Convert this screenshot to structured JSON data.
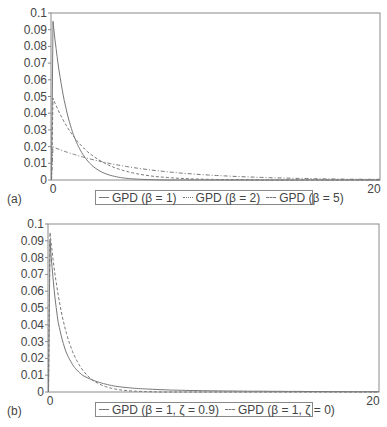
{
  "chart_data": [
    {
      "type": "line",
      "panel_label": "(a)",
      "title": "",
      "xlabel": "",
      "ylabel": "",
      "xlim": [
        0,
        20
      ],
      "ylim": [
        0,
        0.1
      ],
      "x_ticks": [
        "0",
        "20"
      ],
      "y_ticks": [
        "0",
        "0.01",
        "0.02",
        "0.03",
        "0.04",
        "0.05",
        "0.06",
        "0.07",
        "0.08",
        "0.09",
        "0.1"
      ],
      "grid": false,
      "legend_position": "bottom",
      "x": [
        0,
        0.5,
        1,
        1.5,
        2,
        3,
        4,
        5,
        6,
        8,
        10,
        12,
        14,
        16,
        18,
        20
      ],
      "series": [
        {
          "name": "GPD (β = 1)",
          "style": "solid",
          "values": [
            0.095,
            0.0576,
            0.0349,
            0.0212,
            0.0129,
            0.0047,
            0.0017,
            0.0006,
            0.0002,
            0.0,
            0.0,
            0.0,
            0.0,
            0.0,
            0.0,
            0.0
          ]
        },
        {
          "name": "GPD (β = 2)",
          "style": "dashed",
          "values": [
            0.049,
            0.0382,
            0.0297,
            0.0231,
            0.018,
            0.0109,
            0.0066,
            0.004,
            0.0024,
            0.0009,
            0.0003,
            0.0001,
            0.0,
            0.0,
            0.0,
            0.0
          ]
        },
        {
          "name": "GPD (β = 5)",
          "style": "dash-dot",
          "values": [
            0.0198,
            0.0179,
            0.0162,
            0.0147,
            0.0133,
            0.0109,
            0.0089,
            0.0073,
            0.006,
            0.004,
            0.0027,
            0.0018,
            0.0012,
            0.0008,
            0.0005,
            0.0004
          ]
        }
      ]
    },
    {
      "type": "line",
      "panel_label": "(b)",
      "title": "",
      "xlabel": "",
      "ylabel": "",
      "xlim": [
        0,
        20
      ],
      "ylim": [
        0,
        0.1
      ],
      "x_ticks": [
        "0",
        "20"
      ],
      "y_ticks": [
        "0",
        "0.01",
        "0.02",
        "0.03",
        "0.04",
        "0.05",
        "0.06",
        "0.07",
        "0.08",
        "0.09",
        "0.1"
      ],
      "grid": false,
      "legend_position": "bottom",
      "x": [
        0,
        0.5,
        1,
        1.5,
        2,
        3,
        4,
        5,
        6,
        8,
        10,
        12,
        14,
        16,
        18,
        20
      ],
      "series": [
        {
          "name": "GPD (β = 1, ζ = 0.9)",
          "style": "solid",
          "values": [
            0.09,
            0.0414,
            0.0232,
            0.0145,
            0.0098,
            0.0057,
            0.0034,
            0.0023,
            0.0017,
            0.001,
            0.0007,
            0.0005,
            0.0004,
            0.0003,
            0.0002,
            0.0002
          ]
        },
        {
          "name": "GPD (β = 1, ζ = 0)",
          "style": "dashed",
          "values": [
            0.095,
            0.0576,
            0.0349,
            0.0212,
            0.0129,
            0.0047,
            0.0017,
            0.0006,
            0.0002,
            0.0,
            0.0,
            0.0,
            0.0,
            0.0,
            0.0,
            0.0
          ]
        }
      ]
    }
  ],
  "panels": [
    {
      "label": "(a)",
      "x_min_label": "0",
      "x_max_label": "20",
      "legend": [
        "GPD (β = 1)",
        "GPD (β = 2)",
        "GPD (β = 5)"
      ]
    },
    {
      "label": "(b)",
      "x_min_label": "0",
      "x_max_label": "20",
      "legend": [
        "GPD (β = 1, ζ = 0.9)",
        "GPD (β = 1, ζ = 0)"
      ]
    }
  ],
  "y_tick_labels": [
    "0",
    "0.01",
    "0.02",
    "0.03",
    "0.04",
    "0.05",
    "0.06",
    "0.07",
    "0.08",
    "0.09",
    "0.1"
  ],
  "colors": {
    "line": "#777777",
    "axis": "#8a8a8a",
    "text": "#444444"
  }
}
